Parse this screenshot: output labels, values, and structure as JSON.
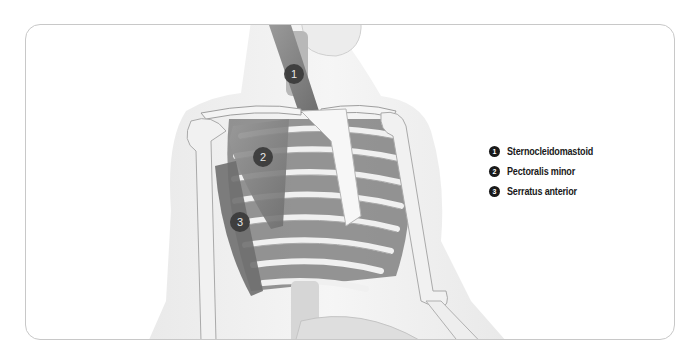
{
  "diagram": {
    "markers": [
      {
        "number": "1",
        "x": 283,
        "y": 73
      },
      {
        "number": "2",
        "x": 262,
        "y": 156
      },
      {
        "number": "3",
        "x": 239,
        "y": 221
      }
    ],
    "legend": [
      {
        "number": "1",
        "label": "Sternocleidomastoid"
      },
      {
        "number": "2",
        "label": "Pectoralis minor"
      },
      {
        "number": "3",
        "label": "Serratus anterior"
      }
    ],
    "colors": {
      "frame_border": "#c8c8c8",
      "marker_fill": "#3a3a3a",
      "legend_dot": "#1a1a1a",
      "bone": "#f2f2f2",
      "muscle": "#8a8a8a"
    }
  }
}
